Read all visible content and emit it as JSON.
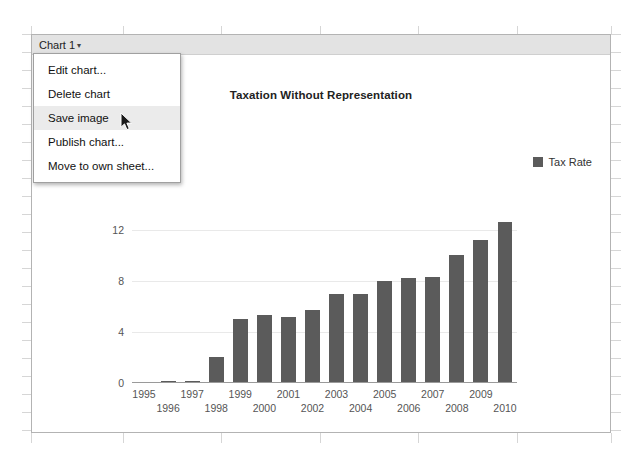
{
  "window": {
    "background_color": "#ffffff",
    "grid_line_color": "#d6d6d6"
  },
  "chart_object": {
    "header": {
      "name_label": "Chart 1",
      "caret_icon": "chevron-down-icon",
      "caret_glyph": "▾",
      "background_color": "#e3e3e3"
    },
    "border_color": "#b3b3b3"
  },
  "menu": {
    "items": [
      {
        "label": "Edit chart...",
        "highlighted": false
      },
      {
        "label": "Delete chart",
        "highlighted": false
      },
      {
        "label": "Save image",
        "highlighted": true
      },
      {
        "label": "Publish chart...",
        "highlighted": false
      },
      {
        "label": "Move to own sheet...",
        "highlighted": false
      }
    ],
    "highlight_color": "#ebebeb"
  },
  "cursor": {
    "icon": "arrow-pointer-icon",
    "x": 120,
    "y": 112
  },
  "chart_data": {
    "type": "bar",
    "title": "Taxation Without Representation",
    "title_visible_fragment": "on Without Representation",
    "xlabel": "",
    "ylabel": "",
    "ylim": [
      0,
      14
    ],
    "yticks": [
      0,
      4,
      8,
      12
    ],
    "grid": true,
    "legend_position": "right",
    "bar_color": "#5b5b5b",
    "gridline_color": "#e9e9e9",
    "axis_color": "#9a9a9a",
    "categories": [
      "1995",
      "1996",
      "1997",
      "1998",
      "1999",
      "2000",
      "2001",
      "2002",
      "2003",
      "2004",
      "2005",
      "2006",
      "2007",
      "2008",
      "2009",
      "2010"
    ],
    "series": [
      {
        "name": "Tax Rate",
        "values": [
          0.05,
          0.12,
          0.18,
          2.0,
          5.0,
          5.3,
          5.2,
          5.7,
          7.0,
          7.0,
          8.0,
          8.2,
          8.3,
          10.0,
          11.2,
          12.6
        ]
      }
    ]
  }
}
